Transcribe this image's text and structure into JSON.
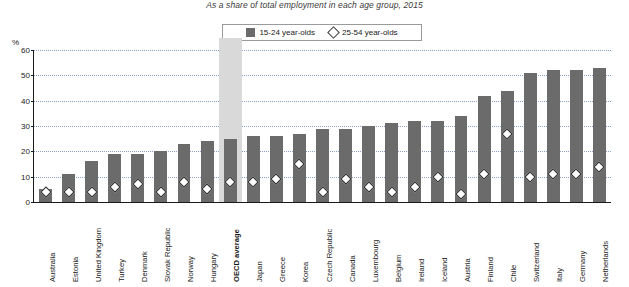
{
  "subtitle": "As a share of total employment in each age group, 2015",
  "legend": {
    "items": [
      {
        "label": "15-24 year-olds",
        "marker": "bar-swatch",
        "color": "#6b6b6b"
      },
      {
        "label": "25-54 year-olds",
        "marker": "diamond-swatch",
        "color": "#ffffff"
      }
    ]
  },
  "axis": {
    "unit_label": "%",
    "yticks": [
      "0",
      "10",
      "20",
      "30",
      "40",
      "50",
      "60"
    ]
  },
  "highlight_category": "OECD average",
  "chart_data": {
    "type": "bar",
    "title": "",
    "subtitle": "As a share of total employment in each age group, 2015",
    "xlabel": "",
    "ylabel": "%",
    "ylim": [
      0,
      60
    ],
    "yticks": [
      0,
      10,
      20,
      30,
      40,
      50,
      60
    ],
    "grid": true,
    "legend_position": "top-center",
    "categories": [
      "Australia",
      "Estonia",
      "United Kingdom",
      "Turkey",
      "Denmark",
      "Slovak Republic",
      "Norway",
      "Hungary",
      "OECD average",
      "Japan",
      "Greece",
      "Korea",
      "Czech Republic",
      "Canada",
      "Luxembourg",
      "Belgium",
      "Ireland",
      "Iceland",
      "Austria",
      "Finland",
      "Chile",
      "Switzerland",
      "Italy",
      "Germany",
      "Netherlands"
    ],
    "series": [
      {
        "name": "15-24 year-olds",
        "type": "bar",
        "values": [
          5,
          11,
          16,
          19,
          19,
          20,
          23,
          24,
          25,
          26,
          26,
          27,
          29,
          29,
          30,
          31,
          32,
          32,
          34,
          42,
          44,
          51,
          52,
          52,
          53
        ]
      },
      {
        "name": "25-54 year-olds",
        "type": "scatter",
        "marker": "diamond",
        "values": [
          4,
          4,
          4,
          6,
          7,
          4,
          8,
          5,
          8,
          8,
          9,
          15,
          4,
          9,
          6,
          4,
          6,
          10,
          3,
          11,
          27,
          10,
          11,
          11,
          14
        ]
      }
    ]
  }
}
